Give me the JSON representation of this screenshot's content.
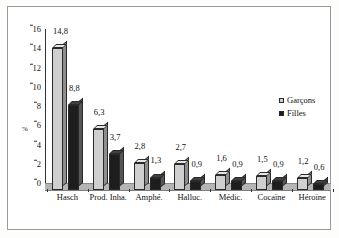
{
  "chart_data": {
    "type": "bar",
    "title": "",
    "subtitle": "",
    "xlabel": "",
    "ylabel": "%",
    "ylim": [
      0,
      16
    ],
    "yticks": [
      0,
      2,
      4,
      6,
      8,
      10,
      12,
      14,
      16
    ],
    "ytick_labels": [
      "0",
      "2",
      "4",
      "6",
      "8",
      "10",
      "12",
      "14",
      "16"
    ],
    "grid": false,
    "legend_position": "right",
    "decimal_separator": ",",
    "categories": [
      "Hasch",
      "Prod. Inha.",
      "Amphé.",
      "Halluc.",
      "Médic.",
      "Cocaïne",
      "Héroïne"
    ],
    "series": [
      {
        "name": "Garçons",
        "color": "#cfcfcf",
        "values": [
          14.8,
          6.3,
          2.8,
          2.7,
          1.6,
          1.5,
          1.2
        ],
        "labels": [
          "14,8",
          "6,3",
          "2,8",
          "2,7",
          "1,6",
          "1,5",
          "1,2"
        ]
      },
      {
        "name": "Filles",
        "color": "#1d1d1d",
        "values": [
          8.8,
          3.7,
          1.3,
          0.9,
          0.9,
          0.9,
          0.6
        ],
        "labels": [
          "8,8",
          "3,7",
          "1,3",
          "0,9",
          "0,9",
          "0,9",
          "0,6"
        ]
      }
    ]
  },
  "legend": {
    "items": [
      {
        "label": "Garçons",
        "color": "#cfcfcf"
      },
      {
        "label": "Filles",
        "color": "#1d1d1d"
      }
    ]
  }
}
